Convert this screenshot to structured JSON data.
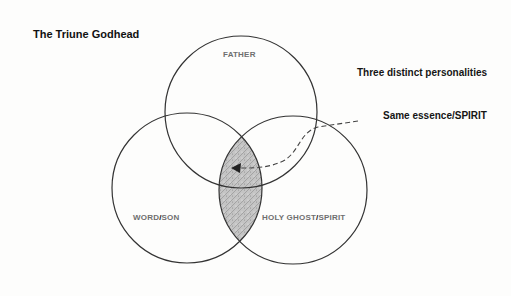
{
  "title": "The Triune Godhead",
  "annotations": {
    "personalities": "Three distinct personalities",
    "essence": "Same essence/SPIRIT"
  },
  "circles": {
    "father": {
      "label": "FATHER"
    },
    "son": {
      "label_a": "WORD",
      "slash": "/",
      "label_b": "SON"
    },
    "spirit": {
      "label_a": "HOLY GHOST",
      "slash": "/",
      "label_b": "SPIRIT"
    }
  },
  "colors": {
    "outline": "#333333",
    "shading": "#b8b8b8",
    "label_gray": "#6f6f6f",
    "text_dark": "#111111"
  }
}
